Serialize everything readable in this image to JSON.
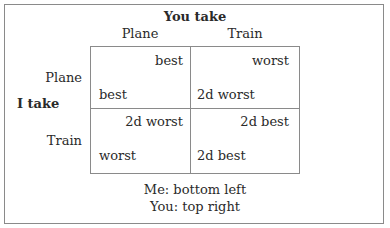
{
  "column_header": {
    "title": "You take",
    "options": [
      "Plane",
      "Train"
    ]
  },
  "row_header": {
    "title": "I take",
    "options": [
      "Plane",
      "Train"
    ]
  },
  "cells": [
    [
      {
        "you": "best",
        "me": "best"
      },
      {
        "you": "worst",
        "me": "2d worst"
      }
    ],
    [
      {
        "you": "2d worst",
        "me": "worst"
      },
      {
        "you": "2d best",
        "me": "2d best"
      }
    ]
  ],
  "legend": {
    "me": "Me: bottom left",
    "you": "You: top right"
  }
}
